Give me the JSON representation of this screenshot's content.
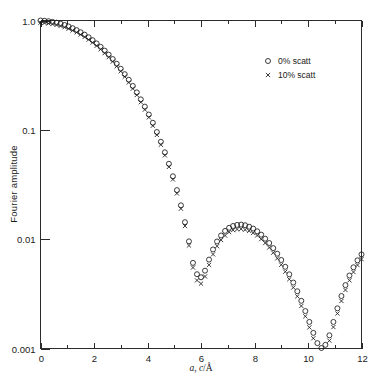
{
  "chart_data": {
    "type": "scatter",
    "title": "",
    "xlabel": "a, c/Å",
    "ylabel": "Fourier amplitude",
    "xlim": [
      0,
      12
    ],
    "ylim": [
      0.001,
      1.0
    ],
    "yscale": "log",
    "grid": false,
    "legend_position": "top-right",
    "xticks": [
      0,
      2,
      4,
      6,
      8,
      10,
      12
    ],
    "xticklabels": [
      "0",
      "2",
      "4",
      "6",
      "8",
      "10",
      "12"
    ],
    "xminorticks": [
      1,
      3,
      5,
      7,
      9,
      11
    ],
    "yticks": [
      1.0,
      0.1,
      0.01,
      0.001
    ],
    "yticklabels": [
      "1.0",
      "0.1",
      "0.01",
      "0.001"
    ],
    "series": [
      {
        "name": "0% scatt",
        "marker": "circle",
        "x": [
          0.0,
          0.15,
          0.3,
          0.45,
          0.6,
          0.75,
          0.9,
          1.05,
          1.2,
          1.35,
          1.5,
          1.65,
          1.8,
          1.95,
          2.1,
          2.25,
          2.4,
          2.55,
          2.7,
          2.85,
          3.0,
          3.15,
          3.3,
          3.45,
          3.6,
          3.75,
          3.9,
          4.05,
          4.2,
          4.35,
          4.5,
          4.65,
          4.8,
          4.95,
          5.1,
          5.25,
          5.4,
          5.55,
          5.7,
          5.85,
          6.0,
          6.15,
          6.3,
          6.45,
          6.6,
          6.75,
          6.9,
          7.05,
          7.2,
          7.35,
          7.5,
          7.65,
          7.8,
          7.95,
          8.1,
          8.25,
          8.4,
          8.55,
          8.7,
          8.85,
          9.0,
          9.15,
          9.3,
          9.45,
          9.6,
          9.75,
          9.9,
          10.05,
          10.2,
          10.35,
          10.5,
          10.65,
          10.8,
          10.95,
          11.1,
          11.25,
          11.4,
          11.55,
          11.7,
          11.85,
          12.0
        ],
        "y": [
          1.0,
          0.995,
          0.985,
          0.972,
          0.955,
          0.934,
          0.91,
          0.882,
          0.851,
          0.817,
          0.781,
          0.742,
          0.702,
          0.66,
          0.617,
          0.574,
          0.53,
          0.487,
          0.444,
          0.402,
          0.362,
          0.323,
          0.287,
          0.252,
          0.22,
          0.19,
          0.163,
          0.138,
          0.116,
          0.0955,
          0.0778,
          0.0623,
          0.0489,
          0.0376,
          0.0281,
          0.0204,
          0.0143,
          0.00955,
          0.00607,
          0.00478,
          0.00448,
          0.00515,
          0.0065,
          0.00805,
          0.00952,
          0.0108,
          0.0119,
          0.0127,
          0.0132,
          0.0135,
          0.0136,
          0.0134,
          0.013,
          0.0125,
          0.0118,
          0.011,
          0.0101,
          0.00922,
          0.00828,
          0.00736,
          0.00645,
          0.00559,
          0.00477,
          0.00401,
          0.00334,
          0.00273,
          0.0022,
          0.00175,
          0.00139,
          0.00112,
          0.00101,
          0.00108,
          0.00132,
          0.00175,
          0.00233,
          0.00302,
          0.0038,
          0.00465,
          0.00553,
          0.0064,
          0.00725
        ]
      },
      {
        "name": "10% scatt",
        "marker": "cross",
        "x": [
          0.0,
          0.15,
          0.3,
          0.45,
          0.6,
          0.75,
          0.9,
          1.05,
          1.2,
          1.35,
          1.5,
          1.65,
          1.8,
          1.95,
          2.1,
          2.25,
          2.4,
          2.55,
          2.7,
          2.85,
          3.0,
          3.15,
          3.3,
          3.45,
          3.6,
          3.75,
          3.9,
          4.05,
          4.2,
          4.35,
          4.5,
          4.65,
          4.8,
          4.95,
          5.1,
          5.25,
          5.4,
          5.55,
          5.7,
          5.85,
          6.0,
          6.15,
          6.3,
          6.45,
          6.6,
          6.75,
          6.9,
          7.05,
          7.2,
          7.35,
          7.5,
          7.65,
          7.8,
          7.95,
          8.1,
          8.25,
          8.4,
          8.55,
          8.7,
          8.85,
          9.0,
          9.15,
          9.3,
          9.45,
          9.6,
          9.75,
          9.9,
          10.05,
          10.2,
          10.35,
          10.5,
          10.65,
          10.8,
          10.95,
          11.1,
          11.25,
          11.4,
          11.55,
          11.7,
          11.85,
          12.0
        ],
        "y": [
          0.955,
          0.95,
          0.94,
          0.928,
          0.911,
          0.891,
          0.868,
          0.841,
          0.811,
          0.779,
          0.744,
          0.707,
          0.668,
          0.628,
          0.587,
          0.545,
          0.503,
          0.462,
          0.421,
          0.381,
          0.343,
          0.306,
          0.271,
          0.238,
          0.208,
          0.179,
          0.153,
          0.13,
          0.109,
          0.0898,
          0.0731,
          0.0584,
          0.0458,
          0.0352,
          0.0262,
          0.019,
          0.0132,
          0.00875,
          0.0055,
          0.0042,
          0.00392,
          0.00456,
          0.00582,
          0.00726,
          0.00862,
          0.00982,
          0.0108,
          0.0116,
          0.0121,
          0.0123,
          0.0124,
          0.0122,
          0.0119,
          0.0114,
          0.0108,
          0.01,
          0.00921,
          0.00838,
          0.00752,
          0.00667,
          0.00583,
          0.00504,
          0.0043,
          0.00361,
          0.003,
          0.00245,
          0.00197,
          0.00156,
          0.00124,
          0.00099,
          0.00089,
          0.00096,
          0.00118,
          0.00157,
          0.00209,
          0.00272,
          0.00343,
          0.0042,
          0.005,
          0.00579,
          0.00657
        ]
      }
    ],
    "legend": [
      {
        "marker": "circle",
        "label": "0% scatt"
      },
      {
        "marker": "cross",
        "label": "10% scatt"
      }
    ]
  },
  "colors": {
    "axis": "#2b2b2b",
    "marker": "#1a1a1a",
    "background": "#ffffff"
  }
}
